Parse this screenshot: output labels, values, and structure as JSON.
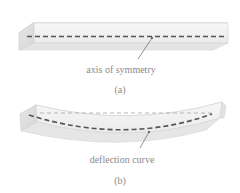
{
  "figure": {
    "panel_a": {
      "label": "(a)",
      "annotation": "axis of symmetry",
      "description": "straight prismatic beam with dashed axis of symmetry"
    },
    "panel_b": {
      "label": "(b)",
      "annotation": "deflection curve",
      "description": "bent beam with dashed deflection curve and light dashed original axis"
    }
  },
  "colors": {
    "beam_face": "#f2f2f2",
    "beam_top": "#fafafa",
    "beam_end": "#dedede",
    "beam_edge": "#cfcfcf",
    "dash": "#555555",
    "light_dash": "#b5b5b5",
    "text": "#8a8a8a",
    "leader": "#666666"
  }
}
